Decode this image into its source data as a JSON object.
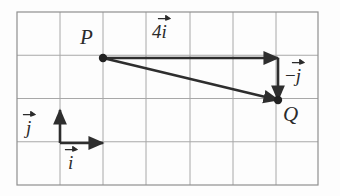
{
  "figure": {
    "colors": {
      "background": "#fdfdfd",
      "grid_line": "#a8a8a8",
      "grid_border": "#8f8f8f",
      "vector": "#2e2e2e",
      "point": "#222222",
      "label": "#2b2b2b"
    },
    "grid": {
      "columns": 7,
      "rows": 4,
      "x_left": 17,
      "x_right": 318,
      "y_top": 12,
      "y_bottom": 185,
      "cell_width": 43,
      "cell_height": 43.25,
      "x_lines": [
        17,
        60,
        103,
        146,
        190,
        233,
        276,
        318
      ],
      "y_lines": [
        12,
        55.25,
        98.5,
        141.75,
        185
      ]
    },
    "points": [
      {
        "id": "P",
        "label": "P",
        "x": 103,
        "y": 58,
        "label_x": 80,
        "label_y": 27
      },
      {
        "id": "Q",
        "label": "Q",
        "x": 278,
        "y": 100,
        "label_x": 283,
        "label_y": 104
      }
    ],
    "vectors": [
      {
        "id": "four-i",
        "name": "horizontal-vector-4i",
        "x1": 103,
        "y1": 58,
        "x2": 278,
        "y2": 58,
        "label_scalar": "4",
        "label_glyph": "i",
        "label_sign": "",
        "label_x": 152,
        "label_y": 20
      },
      {
        "id": "minus-j",
        "name": "vertical-vector-minus-j",
        "x1": 278,
        "y1": 58,
        "x2": 278,
        "y2": 100,
        "label_scalar": "",
        "label_glyph": "j",
        "label_sign": "−",
        "label_x": 285,
        "label_y": 64
      },
      {
        "id": "resultant-pq",
        "name": "resultant-vector-p-to-q",
        "x1": 103,
        "y1": 58,
        "x2": 278,
        "y2": 100,
        "label_scalar": "",
        "label_glyph": "",
        "label_sign": "",
        "label_x": 0,
        "label_y": 0
      }
    ],
    "basis": {
      "origin_x": 60,
      "origin_y": 143,
      "j": {
        "id": "basis-j",
        "x1": 60,
        "y1": 143,
        "x2": 60,
        "y2": 110,
        "glyph": "j",
        "label_x": 26,
        "label_y": 116
      },
      "i": {
        "id": "basis-i",
        "x1": 60,
        "y1": 143,
        "x2": 103,
        "y2": 143,
        "glyph": "i",
        "label_x": 68,
        "label_y": 151
      }
    }
  }
}
